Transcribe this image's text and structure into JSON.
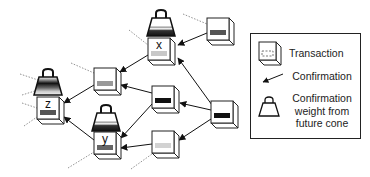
{
  "diagram": {
    "nodes": [
      {
        "id": "x",
        "label": "x",
        "x": 148,
        "y": 38,
        "fill": "#c8c8c8",
        "weight": true
      },
      {
        "id": "top-right",
        "label": "",
        "x": 207,
        "y": 18,
        "fill": "#555555",
        "weight": false
      },
      {
        "id": "mid-upper-left",
        "label": "",
        "x": 94,
        "y": 68,
        "fill": "#999999",
        "weight": false
      },
      {
        "id": "z",
        "label": "z",
        "x": 37,
        "y": 97,
        "fill": "#555555",
        "weight": true
      },
      {
        "id": "center-dark",
        "label": "",
        "x": 152,
        "y": 86,
        "fill": "#111111",
        "weight": false
      },
      {
        "id": "right-dark",
        "label": "",
        "x": 211,
        "y": 101,
        "fill": "#111111",
        "weight": false
      },
      {
        "id": "y",
        "label": "y",
        "x": 94,
        "y": 132,
        "fill": "#666666",
        "weight": true
      },
      {
        "id": "bottom-light",
        "label": "",
        "x": 152,
        "y": 131,
        "fill": "#d2d2d2",
        "weight": false
      }
    ],
    "edges": [
      {
        "from": "top-right",
        "to": "x"
      },
      {
        "from": "right-dark",
        "to": "x"
      },
      {
        "from": "x",
        "to": "mid-upper-left"
      },
      {
        "from": "center-dark",
        "to": "mid-upper-left"
      },
      {
        "from": "mid-upper-left",
        "to": "z"
      },
      {
        "from": "y",
        "to": "z"
      },
      {
        "from": "right-dark",
        "to": "center-dark"
      },
      {
        "from": "center-dark",
        "to": "y"
      },
      {
        "from": "right-dark",
        "to": "bottom-light"
      },
      {
        "from": "bottom-light",
        "to": "y"
      }
    ]
  },
  "legend": {
    "transaction_label": "Transaction",
    "confirmation_label": "Confirmation",
    "weight_label_line1": "Confirmation",
    "weight_label_line2": "weight from",
    "weight_label_line3": "future cone"
  }
}
